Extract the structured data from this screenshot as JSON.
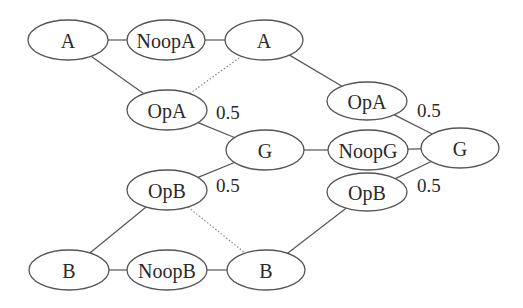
{
  "diagram": {
    "nodes": [
      {
        "id": "A1",
        "label": "A",
        "cx": 68,
        "cy": 40,
        "rx": 40,
        "ry": 20
      },
      {
        "id": "NoopA",
        "label": "NoopA",
        "cx": 166,
        "cy": 40,
        "rx": 39,
        "ry": 20
      },
      {
        "id": "A2",
        "label": "A",
        "cx": 264,
        "cy": 40,
        "rx": 39,
        "ry": 20
      },
      {
        "id": "OpA1",
        "label": "OpA",
        "cx": 167,
        "cy": 110,
        "rx": 40,
        "ry": 20
      },
      {
        "id": "OpA2",
        "label": "OpA",
        "cx": 367,
        "cy": 101,
        "rx": 40,
        "ry": 19
      },
      {
        "id": "G1",
        "label": "G",
        "cx": 265,
        "cy": 150,
        "rx": 39,
        "ry": 20
      },
      {
        "id": "NoopG",
        "label": "NoopG",
        "cx": 368,
        "cy": 150,
        "rx": 40,
        "ry": 20
      },
      {
        "id": "G2",
        "label": "G",
        "cx": 460,
        "cy": 148,
        "rx": 39,
        "ry": 20
      },
      {
        "id": "OpB1",
        "label": "OpB",
        "cx": 167,
        "cy": 190,
        "rx": 40,
        "ry": 20
      },
      {
        "id": "OpB2",
        "label": "OpB",
        "cx": 367,
        "cy": 192,
        "rx": 40,
        "ry": 19
      },
      {
        "id": "B1",
        "label": "B",
        "cx": 69,
        "cy": 270,
        "rx": 40,
        "ry": 20
      },
      {
        "id": "NoopB",
        "label": "NoopB",
        "cx": 167,
        "cy": 270,
        "rx": 40,
        "ry": 20
      },
      {
        "id": "B2",
        "label": "B",
        "cx": 266,
        "cy": 270,
        "rx": 39,
        "ry": 20
      }
    ],
    "edges": [
      {
        "from": "A1",
        "to": "NoopA",
        "style": "solid"
      },
      {
        "from": "NoopA",
        "to": "A2",
        "style": "solid"
      },
      {
        "from": "A1",
        "to": "OpA1",
        "style": "solid"
      },
      {
        "from": "OpA1",
        "to": "A2",
        "style": "dotted"
      },
      {
        "from": "OpA1",
        "to": "G1",
        "style": "solid",
        "weight": "0.5"
      },
      {
        "from": "A2",
        "to": "OpA2",
        "style": "solid"
      },
      {
        "from": "OpA2",
        "to": "G2",
        "style": "solid",
        "weight": "0.5"
      },
      {
        "from": "G1",
        "to": "NoopG",
        "style": "solid"
      },
      {
        "from": "NoopG",
        "to": "G2",
        "style": "solid"
      },
      {
        "from": "OpB1",
        "to": "G1",
        "style": "solid",
        "weight": "0.5"
      },
      {
        "from": "OpB1",
        "to": "B2",
        "style": "dotted"
      },
      {
        "from": "B1",
        "to": "OpB1",
        "style": "solid"
      },
      {
        "from": "B1",
        "to": "NoopB",
        "style": "solid"
      },
      {
        "from": "NoopB",
        "to": "B2",
        "style": "solid"
      },
      {
        "from": "B2",
        "to": "OpB2",
        "style": "solid"
      },
      {
        "from": "OpB2",
        "to": "G2",
        "style": "solid",
        "weight": "0.5"
      }
    ],
    "weight_labels": [
      {
        "text": "0.5",
        "x": 216,
        "y": 112
      },
      {
        "text": "0.5",
        "x": 216,
        "y": 185
      },
      {
        "text": "0.5",
        "x": 417,
        "y": 110
      },
      {
        "text": "0.5",
        "x": 417,
        "y": 185
      }
    ]
  }
}
